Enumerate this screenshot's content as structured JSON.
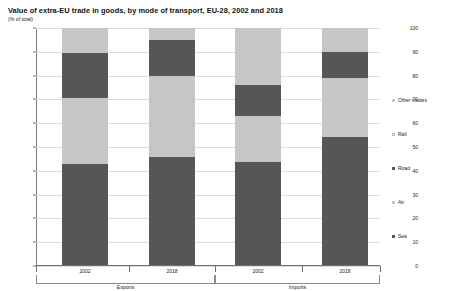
{
  "chart_data": {
    "type": "bar",
    "title": "Value of extra-EU trade in goods, by mode of transport, EU-28, 2002 and 2018",
    "subtitle": "(% of total)",
    "xlabel": "",
    "ylabel": "",
    "ylim": [
      0,
      100
    ],
    "ytick_labels": [
      "100",
      "90",
      "80",
      "70",
      "60",
      "50",
      "40",
      "30",
      "20",
      "10",
      "0"
    ],
    "ytick_values": [
      100,
      90,
      80,
      70,
      60,
      50,
      40,
      30,
      20,
      10,
      0
    ],
    "grid": true,
    "stacked": true,
    "legend_position": "right",
    "categories": [
      "2002",
      "2018",
      "2002",
      "2018"
    ],
    "groups": [
      {
        "label": "Exports",
        "categories": [
          "2002",
          "2018"
        ]
      },
      {
        "label": "Imports",
        "categories": [
          "2002",
          "2018"
        ]
      }
    ],
    "series": [
      {
        "name": "Sea",
        "color": "#565656",
        "values": [
          43.0,
          46.0,
          43.5,
          54.0
        ]
      },
      {
        "name": "Air",
        "color": "#c6c6c6",
        "values": [
          27.5,
          34.0,
          19.5,
          25.0
        ]
      },
      {
        "name": "Road",
        "color": "#565656",
        "values": [
          19.0,
          15.0,
          13.0,
          11.0
        ]
      },
      {
        "name": "Rail",
        "color": "#c6c6c6",
        "values": [
          0.5,
          0.5,
          0.5,
          0.5
        ]
      },
      {
        "name": "Other modes",
        "color": "#c6c6c6",
        "values": [
          10.0,
          4.5,
          23.5,
          9.5
        ]
      }
    ],
    "legend_entries": [
      {
        "label": "Other modes",
        "color": "#c6c6c6"
      },
      {
        "label": "Rail",
        "color": "#c6c6c6"
      },
      {
        "label": "Road",
        "color": "#565656"
      },
      {
        "label": "Air",
        "color": "#c6c6c6"
      },
      {
        "label": "Sea",
        "color": "#565656"
      }
    ]
  }
}
